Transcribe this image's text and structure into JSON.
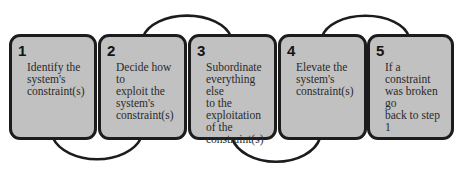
{
  "diagram": {
    "type": "process-cycle",
    "colors": {
      "box_fill": "#c1c1c1",
      "box_border": "#1c1c1c",
      "connector": "#1c1c1c",
      "text": "#2a2a2a"
    },
    "steps": [
      {
        "number": "1",
        "text": "Identify the\nsystem's\nconstraint(s)"
      },
      {
        "number": "2",
        "text": "Decide how to\nexploit the\nsystem's\nconstraint(s)"
      },
      {
        "number": "3",
        "text": "Subordinate\neverything else\nto the\nexploitation\nof the\nconstraint(s)"
      },
      {
        "number": "4",
        "text": "Elevate the\nsystem's\nconstraint(s)"
      },
      {
        "number": "5",
        "text": "If a constraint\nwas broken go\nback to step 1"
      }
    ],
    "connectors": [
      {
        "from": "1",
        "to": "2",
        "position": "bottom"
      },
      {
        "from": "2",
        "to": "3",
        "position": "top"
      },
      {
        "from": "3",
        "to": "4",
        "position": "bottom"
      },
      {
        "from": "4",
        "to": "5",
        "position": "top"
      }
    ]
  }
}
